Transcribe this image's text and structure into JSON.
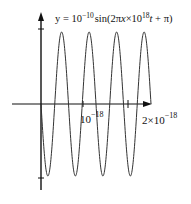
{
  "chart_data": {
    "type": "line",
    "equation": {
      "prefix": "y = 10",
      "exp1": "−10",
      "mid": "sin(2π",
      "italic_x": "x",
      "times": "×10",
      "exp2": "18",
      "suffix_t": "t",
      "end": " + π)"
    },
    "xlabel": "t",
    "ylabel": "y",
    "x_ticks": [
      {
        "value": 1e-18,
        "label_base": "10",
        "label_exp": "−18"
      },
      {
        "value": 2e-18,
        "label_base": "2×10",
        "label_exp": "−18"
      }
    ],
    "amplitude": 1e-10,
    "frequency": 2e+18,
    "phase": 3.14159,
    "periods_shown": 4,
    "x_range": [
      0,
      2e-18
    ],
    "y_range": [
      -1e-10,
      1e-10
    ],
    "grid": false,
    "legend": false,
    "series": [
      {
        "name": "y(t)",
        "function": "1e-10*sin(2*pi*2e18*t + pi)",
        "color": "#222222"
      }
    ]
  }
}
